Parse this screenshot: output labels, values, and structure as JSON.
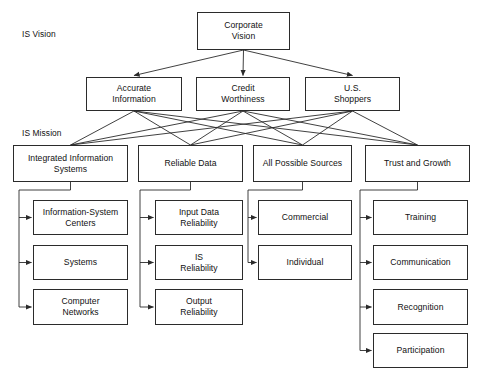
{
  "figure": {
    "background_color": "#ffffff",
    "line_color": "#2b2b2b",
    "text_color": "#111111",
    "caption": ""
  },
  "tier_labels": [
    {
      "id": "is-vision",
      "text": "IS Vision",
      "x": 22,
      "y": 29
    },
    {
      "id": "is-mission",
      "text": "IS Mission",
      "x": 22,
      "y": 128
    }
  ],
  "nodes": {
    "root": {
      "id": "corporate-vision",
      "text": "Corporate\nVision",
      "x": 197,
      "y": 12,
      "w": 93,
      "h": 38
    },
    "vision": [
      {
        "id": "accurate-information",
        "text": "Accurate\nInformation",
        "x": 86,
        "y": 77,
        "w": 96,
        "h": 34
      },
      {
        "id": "credit-worthiness",
        "text": "Credit\nWorthiness",
        "x": 196,
        "y": 77,
        "w": 94,
        "h": 34
      },
      {
        "id": "us-shoppers",
        "text": "U.S.\nShoppers",
        "x": 305,
        "y": 77,
        "w": 95,
        "h": 34
      }
    ],
    "mission": [
      {
        "id": "integrated-information-systems",
        "text": "Integrated Information\nSystems",
        "x": 13,
        "y": 145,
        "w": 115,
        "h": 37
      },
      {
        "id": "reliable-data",
        "text": "Reliable Data",
        "x": 138,
        "y": 145,
        "w": 105,
        "h": 37
      },
      {
        "id": "all-possible-sources",
        "text": "All Possible Sources",
        "x": 253,
        "y": 145,
        "w": 99,
        "h": 37
      },
      {
        "id": "trust-and-growth",
        "text": "Trust and Growth",
        "x": 365,
        "y": 145,
        "w": 105,
        "h": 37
      }
    ],
    "children": [
      {
        "parent": "integrated-information-systems",
        "spine_x": 19,
        "items": [
          {
            "id": "information-system-centers",
            "text": "Information-System\nCenters",
            "x": 33,
            "y": 200,
            "w": 95,
            "h": 35
          },
          {
            "id": "systems",
            "text": "Systems",
            "x": 33,
            "y": 245,
            "w": 95,
            "h": 35
          },
          {
            "id": "computer-networks",
            "text": "Computer\nNetworks",
            "x": 33,
            "y": 289,
            "w": 95,
            "h": 36
          }
        ]
      },
      {
        "parent": "reliable-data",
        "spine_x": 140,
        "items": [
          {
            "id": "input-data-reliability",
            "text": "Input Data\nReliability",
            "x": 155,
            "y": 200,
            "w": 88,
            "h": 35
          },
          {
            "id": "is-reliability",
            "text": "IS\nReliability",
            "x": 155,
            "y": 245,
            "w": 88,
            "h": 35
          },
          {
            "id": "output-reliability",
            "text": "Output\nReliability",
            "x": 155,
            "y": 289,
            "w": 88,
            "h": 36
          }
        ]
      },
      {
        "parent": "all-possible-sources",
        "spine_x": 248,
        "items": [
          {
            "id": "commercial",
            "text": "Commercial",
            "x": 258,
            "y": 200,
            "w": 94,
            "h": 35
          },
          {
            "id": "individual",
            "text": "Individual",
            "x": 258,
            "y": 245,
            "w": 94,
            "h": 35
          }
        ]
      },
      {
        "parent": "trust-and-growth",
        "spine_x": 360,
        "items": [
          {
            "id": "training",
            "text": "Training",
            "x": 373,
            "y": 200,
            "w": 95,
            "h": 35
          },
          {
            "id": "communication",
            "text": "Communication",
            "x": 373,
            "y": 245,
            "w": 95,
            "h": 35
          },
          {
            "id": "recognition",
            "text": "Recognition",
            "x": 373,
            "y": 289,
            "w": 95,
            "h": 36
          },
          {
            "id": "participation",
            "text": "Participation",
            "x": 373,
            "y": 333,
            "w": 95,
            "h": 35
          }
        ]
      }
    ]
  },
  "edges": {
    "root_to_vision": [
      {
        "from": "corporate-vision",
        "to": "accurate-information"
      },
      {
        "from": "corporate-vision",
        "to": "credit-worthiness"
      },
      {
        "from": "corporate-vision",
        "to": "us-shoppers"
      }
    ],
    "vision_to_mission_mesh": [
      {
        "from": "accurate-information",
        "to": "integrated-information-systems"
      },
      {
        "from": "accurate-information",
        "to": "reliable-data"
      },
      {
        "from": "accurate-information",
        "to": "all-possible-sources"
      },
      {
        "from": "accurate-information",
        "to": "trust-and-growth"
      },
      {
        "from": "credit-worthiness",
        "to": "integrated-information-systems"
      },
      {
        "from": "credit-worthiness",
        "to": "reliable-data"
      },
      {
        "from": "credit-worthiness",
        "to": "all-possible-sources"
      },
      {
        "from": "credit-worthiness",
        "to": "trust-and-growth"
      },
      {
        "from": "us-shoppers",
        "to": "integrated-information-systems"
      },
      {
        "from": "us-shoppers",
        "to": "reliable-data"
      },
      {
        "from": "us-shoppers",
        "to": "all-possible-sources"
      },
      {
        "from": "us-shoppers",
        "to": "trust-and-growth"
      }
    ]
  }
}
